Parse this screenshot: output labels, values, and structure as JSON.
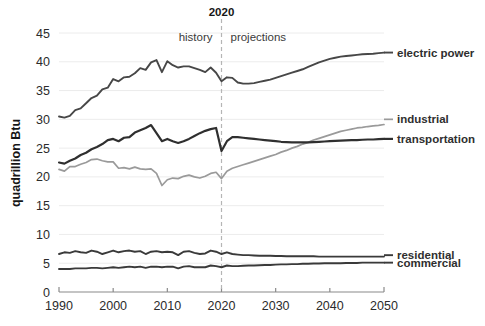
{
  "chart_data": {
    "type": "line",
    "title": "",
    "xlabel": "",
    "ylabel": "quadrillion Btu",
    "xlim": [
      1990,
      2050
    ],
    "ylim": [
      0,
      45
    ],
    "xticks": [
      1990,
      2000,
      2010,
      2020,
      2030,
      2040,
      2050
    ],
    "yticks": [
      0,
      5,
      10,
      15,
      20,
      25,
      30,
      35,
      40,
      45
    ],
    "grid": "horizontal",
    "legend_position": "right-inline",
    "annotations": {
      "divider_year": 2020,
      "divider_title": "2020",
      "left_label": "history",
      "right_label": "projections"
    },
    "x": [
      1990,
      1991,
      1992,
      1993,
      1994,
      1995,
      1996,
      1997,
      1998,
      1999,
      2000,
      2001,
      2002,
      2003,
      2004,
      2005,
      2006,
      2007,
      2008,
      2009,
      2010,
      2011,
      2012,
      2013,
      2014,
      2015,
      2016,
      2017,
      2018,
      2019,
      2020,
      2021,
      2022,
      2023,
      2024,
      2025,
      2026,
      2027,
      2028,
      2029,
      2030,
      2031,
      2032,
      2033,
      2034,
      2035,
      2036,
      2037,
      2038,
      2039,
      2040,
      2041,
      2042,
      2043,
      2044,
      2045,
      2046,
      2047,
      2048,
      2049,
      2050
    ],
    "series": [
      {
        "name": "electric power",
        "label": "electric power",
        "color": "#474747",
        "width": 1.9,
        "label_color": "#2f2f2f",
        "label_weight": "bold",
        "label_y_value": 41.6,
        "values": [
          30.5,
          30.3,
          30.6,
          31.6,
          31.9,
          32.8,
          33.7,
          34.1,
          35.2,
          35.5,
          37.0,
          36.6,
          37.3,
          37.4,
          38.0,
          38.9,
          38.6,
          39.9,
          40.3,
          38.2,
          40.1,
          39.4,
          39.0,
          39.2,
          39.2,
          38.9,
          38.6,
          38.2,
          39.0,
          38.1,
          36.6,
          37.3,
          37.2,
          36.4,
          36.2,
          36.2,
          36.3,
          36.5,
          36.7,
          36.9,
          37.2,
          37.5,
          37.8,
          38.1,
          38.4,
          38.7,
          39.1,
          39.5,
          39.9,
          40.2,
          40.5,
          40.7,
          40.9,
          41.0,
          41.1,
          41.2,
          41.3,
          41.35,
          41.4,
          41.5,
          41.6
        ]
      },
      {
        "name": "industrial",
        "label": "industrial",
        "color": "#9a9a9a",
        "width": 1.7,
        "label_color": "#9a9a9a",
        "label_weight": "normal",
        "label_y_value": 30.0,
        "values": [
          21.3,
          21.0,
          21.8,
          21.8,
          22.2,
          22.5,
          23.0,
          23.1,
          22.8,
          22.6,
          22.6,
          21.5,
          21.6,
          21.4,
          21.7,
          21.4,
          21.3,
          21.4,
          20.6,
          18.5,
          19.5,
          19.8,
          19.7,
          20.1,
          20.3,
          20.0,
          19.8,
          20.1,
          20.6,
          20.8,
          19.7,
          21.0,
          21.5,
          21.8,
          22.1,
          22.4,
          22.7,
          23.0,
          23.3,
          23.6,
          23.9,
          24.3,
          24.6,
          25.0,
          25.3,
          25.7,
          26.0,
          26.4,
          26.7,
          27.0,
          27.3,
          27.6,
          27.9,
          28.1,
          28.3,
          28.5,
          28.6,
          28.75,
          28.85,
          28.95,
          29.1
        ]
      },
      {
        "name": "transportation",
        "label": "transportation",
        "color": "#2f2f2f",
        "width": 2.2,
        "label_color": "#2f2f2f",
        "label_weight": "bold",
        "label_y_value": 26.6,
        "values": [
          22.5,
          22.3,
          22.8,
          23.2,
          23.8,
          24.2,
          24.8,
          25.2,
          25.7,
          26.4,
          26.6,
          26.2,
          26.8,
          26.9,
          27.7,
          28.1,
          28.5,
          29.0,
          27.6,
          26.2,
          26.6,
          26.2,
          25.9,
          26.2,
          26.6,
          27.1,
          27.6,
          28.0,
          28.3,
          28.5,
          24.5,
          26.2,
          26.9,
          26.9,
          26.8,
          26.7,
          26.6,
          26.5,
          26.4,
          26.3,
          26.2,
          26.1,
          26.05,
          26.0,
          26.0,
          26.0,
          26.0,
          26.05,
          26.1,
          26.15,
          26.2,
          26.25,
          26.3,
          26.35,
          26.4,
          26.4,
          26.45,
          26.5,
          26.5,
          26.55,
          26.6
        ]
      },
      {
        "name": "residential",
        "label": "residential",
        "color": "#3a3a3a",
        "width": 1.9,
        "label_color": "#2f2f2f",
        "label_weight": "bold",
        "label_y_value": 6.4,
        "values": [
          6.6,
          6.9,
          6.8,
          7.1,
          6.9,
          6.8,
          7.2,
          7.0,
          6.6,
          6.9,
          7.2,
          6.9,
          7.1,
          7.2,
          7.0,
          7.1,
          6.6,
          7.0,
          7.1,
          6.9,
          7.0,
          6.9,
          6.4,
          7.0,
          7.1,
          6.8,
          6.6,
          6.7,
          7.2,
          7.0,
          6.6,
          6.9,
          6.6,
          6.5,
          6.4,
          6.4,
          6.35,
          6.3,
          6.3,
          6.3,
          6.25,
          6.25,
          6.2,
          6.2,
          6.2,
          6.2,
          6.2,
          6.2,
          6.15,
          6.15,
          6.15,
          6.15,
          6.15,
          6.15,
          6.15,
          6.15,
          6.15,
          6.15,
          6.15,
          6.15,
          6.15
        ]
      },
      {
        "name": "commercial",
        "label": "commercial",
        "color": "#3a3a3a",
        "width": 1.9,
        "label_color": "#2f2f2f",
        "label_weight": "bold",
        "label_y_value": 5.1,
        "values": [
          4.0,
          4.0,
          4.0,
          4.1,
          4.1,
          4.1,
          4.2,
          4.2,
          4.1,
          4.2,
          4.3,
          4.2,
          4.3,
          4.4,
          4.3,
          4.4,
          4.2,
          4.4,
          4.4,
          4.3,
          4.4,
          4.4,
          4.1,
          4.4,
          4.5,
          4.3,
          4.3,
          4.3,
          4.6,
          4.5,
          4.3,
          4.6,
          4.5,
          4.5,
          4.55,
          4.6,
          4.6,
          4.65,
          4.7,
          4.7,
          4.75,
          4.8,
          4.8,
          4.85,
          4.85,
          4.9,
          4.9,
          4.95,
          4.95,
          5.0,
          5.0,
          5.0,
          5.0,
          5.05,
          5.05,
          5.05,
          5.1,
          5.1,
          5.1,
          5.1,
          5.1
        ]
      }
    ]
  }
}
